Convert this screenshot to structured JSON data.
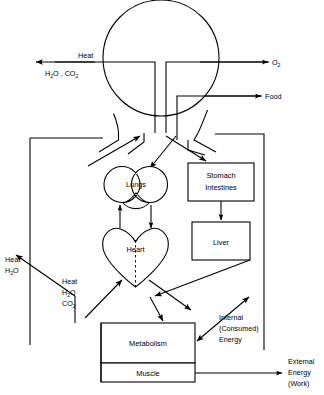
{
  "diagram": {
    "colors": {
      "stroke": "#000000",
      "background": "#ffffff"
    },
    "organs": [
      {
        "id": "lungs",
        "label": "Lungs",
        "shape": "double-lobe"
      },
      {
        "id": "heart",
        "label": "Heart",
        "shape": "heart"
      },
      {
        "id": "stomach",
        "label_line1": "Stomach",
        "label_line2": "Intestines",
        "shape": "rect"
      },
      {
        "id": "liver",
        "label": "Liver",
        "shape": "rect"
      },
      {
        "id": "metabolism",
        "label": "Metabolism",
        "shape": "rect"
      },
      {
        "id": "muscle",
        "label": "Muscle",
        "shape": "rect"
      }
    ],
    "labels": {
      "heat_top": "Heat",
      "h2o_co2_top": "H",
      "h2o_co2_top_sub1": "2",
      "h2o_co2_top_mid": "O , CO",
      "h2o_co2_top_sub2": "2",
      "oxygen": "O",
      "oxygen_sub": "2",
      "food": "Food",
      "heat_left": "Heat",
      "h2o_left": "H",
      "h2o_left_sub": "2",
      "h2o_left_rest": "O",
      "heat_mid": "Heat",
      "h2o_mid": "H",
      "h2o_mid_sub": "2",
      "h2o_mid_rest": "O",
      "co2_mid": "CO",
      "co2_mid_sub": "2",
      "internal_line1": "Internal",
      "internal_line2": "(Consumed)",
      "internal_line3": "Energy",
      "external_line1": "External",
      "external_line2": "Energy",
      "external_line3": "(Work)"
    }
  }
}
